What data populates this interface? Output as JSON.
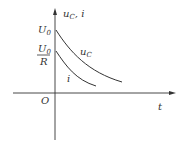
{
  "diagram": {
    "y_axis_label": "u",
    "y_axis_label_sub": "C",
    "y_axis_label_rest": ", i",
    "x_axis_label": "t",
    "origin_label": "O",
    "u0_label": "U",
    "u0_sub": "0",
    "u0r_num": "U",
    "u0r_num_sub": "0",
    "u0r_den": "R",
    "curve_uc_label": "u",
    "curve_uc_sub": "C",
    "curve_i_label": "i",
    "line_color": "#333333"
  }
}
